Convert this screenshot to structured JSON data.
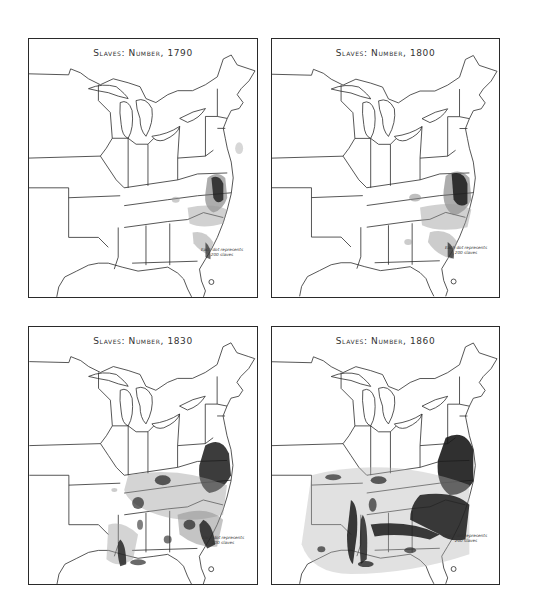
{
  "maps": [
    {
      "title": "Slaves: Number, 1790",
      "year": 1790,
      "legend_line1": "Each dot represents",
      "legend_line2": "200 slaves"
    },
    {
      "title": "Slaves: Number, 1800",
      "year": 1800,
      "legend_line1": "Each dot represents",
      "legend_line2": "200 slaves"
    },
    {
      "title": "Slaves: Number, 1830",
      "year": 1830,
      "legend_line1": "Each dot represents",
      "legend_line2": "200 slaves"
    },
    {
      "title": "Slaves: Number, 1860",
      "year": 1860,
      "legend_line1": "Each dot represents",
      "legend_line2": "200 slaves"
    }
  ],
  "colors": {
    "ink": "#2a2a2a",
    "dense": "#1a1a1a",
    "medium": "#7a7a7a",
    "light": "#c8c8c8",
    "paper": "#ffffff"
  }
}
